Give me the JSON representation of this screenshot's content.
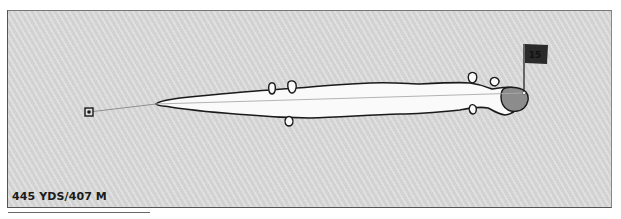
{
  "hole": {
    "number": "15",
    "yardage_label": "445 YDS/407 M"
  },
  "colors": {
    "background": "#d9d9d9",
    "fairway": "#fafafa",
    "green": "#8c8c8c",
    "outline": "#1a1a1a",
    "flag": "#2a2a2a",
    "flag_text": "#111111",
    "aim_line": "#999999"
  }
}
